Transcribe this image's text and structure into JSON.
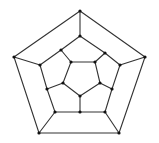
{
  "diagram": {
    "type": "graph",
    "colors": {
      "background": "#ffffff",
      "edge": "#333333",
      "vertex": "#111111"
    },
    "vertices": [
      {
        "id": "o0",
        "x": 80,
        "y": 11
      },
      {
        "id": "o1",
        "x": 145,
        "y": 57
      },
      {
        "id": "o2",
        "x": 119,
        "y": 133
      },
      {
        "id": "o3",
        "x": 39,
        "y": 133
      },
      {
        "id": "o4",
        "x": 14,
        "y": 57
      },
      {
        "id": "m0",
        "x": 80,
        "y": 36
      },
      {
        "id": "m1",
        "x": 105,
        "y": 53
      },
      {
        "id": "m2",
        "x": 120,
        "y": 65
      },
      {
        "id": "m3",
        "x": 112,
        "y": 89
      },
      {
        "id": "m4",
        "x": 105,
        "y": 112
      },
      {
        "id": "m5",
        "x": 80,
        "y": 112
      },
      {
        "id": "m6",
        "x": 55,
        "y": 112
      },
      {
        "id": "m7",
        "x": 47,
        "y": 89
      },
      {
        "id": "m8",
        "x": 40,
        "y": 65
      },
      {
        "id": "m9",
        "x": 61,
        "y": 50
      },
      {
        "id": "i0",
        "x": 71,
        "y": 62
      },
      {
        "id": "i1",
        "x": 95,
        "y": 62
      },
      {
        "id": "i2",
        "x": 100,
        "y": 83
      },
      {
        "id": "i3",
        "x": 80,
        "y": 96
      },
      {
        "id": "i4",
        "x": 63,
        "y": 83
      }
    ],
    "edges": [
      [
        "o0",
        "o1"
      ],
      [
        "o1",
        "o2"
      ],
      [
        "o2",
        "o3"
      ],
      [
        "o3",
        "o4"
      ],
      [
        "o4",
        "o0"
      ],
      [
        "o0",
        "m0"
      ],
      [
        "o1",
        "m2"
      ],
      [
        "o2",
        "m4"
      ],
      [
        "o3",
        "m6"
      ],
      [
        "o4",
        "m8"
      ],
      [
        "m0",
        "m1"
      ],
      [
        "m1",
        "m2"
      ],
      [
        "m2",
        "m3"
      ],
      [
        "m3",
        "m4"
      ],
      [
        "m4",
        "m5"
      ],
      [
        "m5",
        "m6"
      ],
      [
        "m6",
        "m7"
      ],
      [
        "m7",
        "m8"
      ],
      [
        "m8",
        "m9"
      ],
      [
        "m9",
        "m0"
      ],
      [
        "m9",
        "i0"
      ],
      [
        "m1",
        "i1"
      ],
      [
        "m3",
        "i2"
      ],
      [
        "m5",
        "i3"
      ],
      [
        "m7",
        "i4"
      ],
      [
        "i0",
        "i1"
      ],
      [
        "i1",
        "i2"
      ],
      [
        "i2",
        "i3"
      ],
      [
        "i3",
        "i4"
      ],
      [
        "i4",
        "i0"
      ]
    ]
  }
}
